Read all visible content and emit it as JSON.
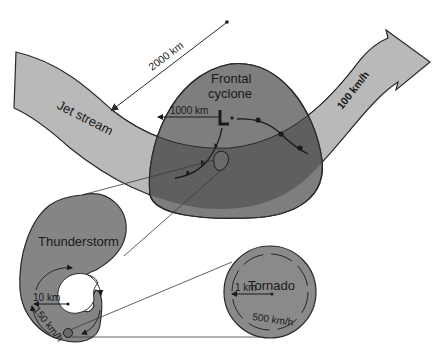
{
  "colors": {
    "background": "#ffffff",
    "jet_stream_fill": "#b9b9b9",
    "cyclone_fill": "#7e7e7e",
    "cyclone_overlap_fill": "#5f5f5f",
    "thunderstorm_fill": "#858585",
    "tornado_fill": "#8a8a8a",
    "outline": "#2a2a2a"
  },
  "labels": {
    "jet_stream": "Jet stream",
    "jet_speed": "100 km/h",
    "jet_width": "2000 km",
    "cyclone_line1": "Frontal",
    "cyclone_line2": "cyclone",
    "cyclone_radius": "1000 km",
    "thunderstorm": "Thunderstorm",
    "thunderstorm_radius": "10 km",
    "thunderstorm_speed": "150 km/h",
    "tornado": "Tornado",
    "tornado_radius": "1 km",
    "tornado_speed": "500 km/h"
  }
}
